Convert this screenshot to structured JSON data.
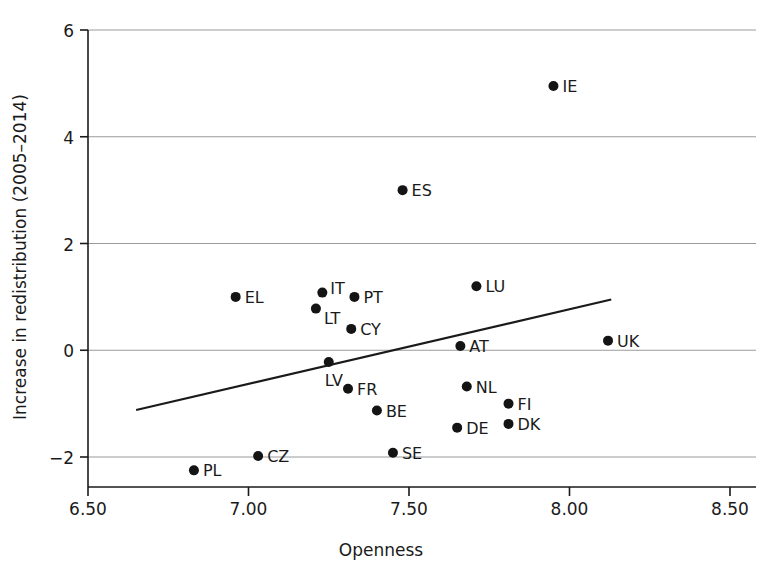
{
  "chart_data": {
    "type": "scatter",
    "title": "",
    "xlabel": "Openness",
    "ylabel": "Increase in redistribution (2005–2014)",
    "xlim": [
      6.5,
      8.5
    ],
    "ylim": [
      -2.6,
      6.0
    ],
    "xticks": [
      "6.50",
      "7.00",
      "7.50",
      "8.00",
      "8.50"
    ],
    "xtick_values": [
      6.5,
      7.0,
      7.5,
      8.0,
      8.5
    ],
    "yticks": [
      "6",
      "4",
      "2",
      "0",
      "−2"
    ],
    "ytick_values": [
      6,
      4,
      2,
      0,
      -2
    ],
    "grid": "horizontal",
    "legend": "none",
    "marker_color": "#141414",
    "line_color": "#1a1a1a",
    "grid_color": "#9a9a9a",
    "points": [
      {
        "label": "IE",
        "x": 7.95,
        "y": 4.95,
        "label_dx": 9,
        "label_dy": 6
      },
      {
        "label": "ES",
        "x": 7.48,
        "y": 3.0,
        "label_dx": 9,
        "label_dy": 6
      },
      {
        "label": "LU",
        "x": 7.71,
        "y": 1.2,
        "label_dx": 9,
        "label_dy": 6
      },
      {
        "label": "IT",
        "x": 7.23,
        "y": 1.08,
        "label_dx": 8,
        "label_dy": 1
      },
      {
        "label": "PT",
        "x": 7.33,
        "y": 1.0,
        "label_dx": 9,
        "label_dy": 6
      },
      {
        "label": "EL",
        "x": 6.96,
        "y": 1.0,
        "label_dx": 9,
        "label_dy": 6
      },
      {
        "label": "LT",
        "x": 7.21,
        "y": 0.78,
        "label_dx": 8,
        "label_dy": 15
      },
      {
        "label": "CY",
        "x": 7.32,
        "y": 0.4,
        "label_dx": 9,
        "label_dy": 6
      },
      {
        "label": "UK",
        "x": 8.12,
        "y": 0.18,
        "label_dx": 9,
        "label_dy": 6
      },
      {
        "label": "AT",
        "x": 7.66,
        "y": 0.08,
        "label_dx": 9,
        "label_dy": 6
      },
      {
        "label": "LV",
        "x": 7.25,
        "y": -0.22,
        "label_dx": -4,
        "label_dy": 24
      },
      {
        "label": "NL",
        "x": 7.68,
        "y": -0.68,
        "label_dx": 9,
        "label_dy": 6
      },
      {
        "label": "FR",
        "x": 7.31,
        "y": -0.72,
        "label_dx": 9,
        "label_dy": 6
      },
      {
        "label": "FI",
        "x": 7.81,
        "y": -1.0,
        "label_dx": 9,
        "label_dy": 6
      },
      {
        "label": "BE",
        "x": 7.4,
        "y": -1.13,
        "label_dx": 9,
        "label_dy": 6
      },
      {
        "label": "DK",
        "x": 7.81,
        "y": -1.38,
        "label_dx": 9,
        "label_dy": 6
      },
      {
        "label": "DE",
        "x": 7.65,
        "y": -1.45,
        "label_dx": 9,
        "label_dy": 6
      },
      {
        "label": "SE",
        "x": 7.45,
        "y": -1.92,
        "label_dx": 9,
        "label_dy": 6
      },
      {
        "label": "CZ",
        "x": 7.03,
        "y": -1.98,
        "label_dx": 9,
        "label_dy": 6
      },
      {
        "label": "PL",
        "x": 6.83,
        "y": -2.25,
        "label_dx": 9,
        "label_dy": 6
      }
    ],
    "fit_line": {
      "x_start": 6.65,
      "y_start": -1.12,
      "x_end": 8.13,
      "y_end": 0.95
    }
  }
}
